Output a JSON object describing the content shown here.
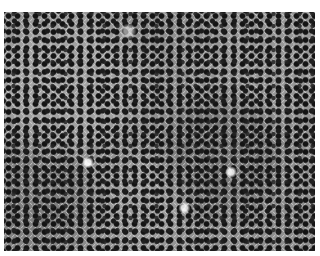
{
  "image": {
    "description": "Grayscale micrograph of densely packed cells with dark nuclei",
    "colors": {
      "background": "#ffffff",
      "cytoplasm": "#8f8f8f",
      "nucleus": "#141414",
      "membrane": "#e1e1e1"
    }
  }
}
